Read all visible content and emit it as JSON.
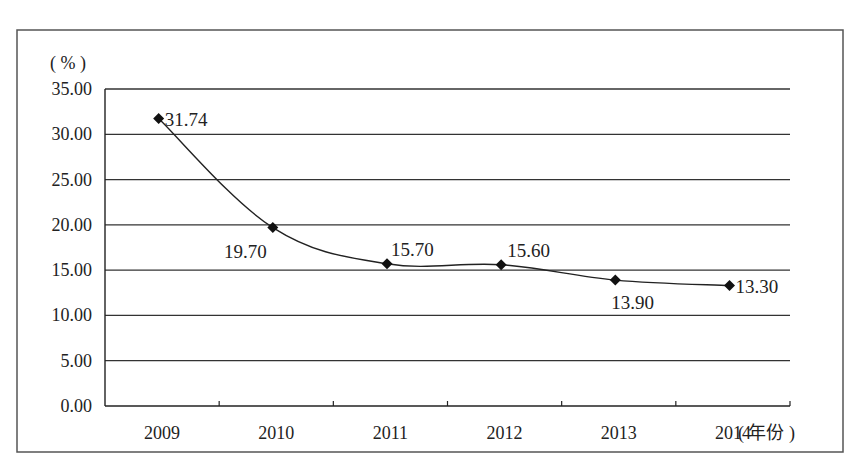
{
  "chart_data": {
    "type": "line",
    "title": "",
    "ylabel": "(%)",
    "xlabel": "(年份)",
    "categories": [
      "2009",
      "2010",
      "2011",
      "2012",
      "2013",
      "2014"
    ],
    "series": [
      {
        "name": "rate",
        "values": [
          31.74,
          19.7,
          15.7,
          15.6,
          13.9,
          13.3
        ],
        "labels": [
          "31.74",
          "19.70",
          "15.70",
          "15.60",
          "13.90",
          "13.30"
        ]
      }
    ],
    "ylim": [
      0,
      35
    ],
    "yticks": [
      "0.00",
      "5.00",
      "10.00",
      "15.00",
      "20.00",
      "25.00",
      "30.00",
      "35.00"
    ],
    "grid": true,
    "legend": "none",
    "smooth": true,
    "marker": "diamond"
  },
  "axis": {
    "y_unit": "( % )",
    "x_unit": "( 年份 )"
  },
  "colors": {
    "line": "#222222",
    "grid": "#333333",
    "frame": "#444444"
  }
}
